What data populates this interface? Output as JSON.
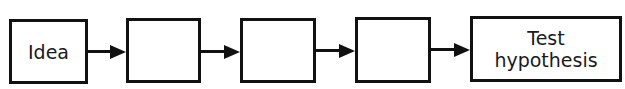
{
  "diagram": {
    "type": "flowchart",
    "direction": "left-to-right",
    "nodes": [
      {
        "id": "n1",
        "label": "Idea"
      },
      {
        "id": "n2",
        "label": ""
      },
      {
        "id": "n3",
        "label": ""
      },
      {
        "id": "n4",
        "label": ""
      },
      {
        "id": "n5",
        "label": "Test\nhypothesis"
      }
    ],
    "edges": [
      {
        "from": "n1",
        "to": "n2"
      },
      {
        "from": "n2",
        "to": "n3"
      },
      {
        "from": "n3",
        "to": "n4"
      },
      {
        "from": "n4",
        "to": "n5"
      }
    ],
    "colors": {
      "stroke": "#111111",
      "fill": "#ffffff",
      "text": "#1a1a1a"
    }
  }
}
